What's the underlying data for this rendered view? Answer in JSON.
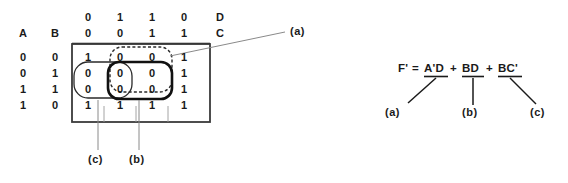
{
  "diagram": {
    "title_note": "Karnaugh map with three groupings and resulting simplified expression",
    "kmap": {
      "row_var_labels": [
        "A",
        "B"
      ],
      "col_var_labels": [
        "D",
        "C"
      ],
      "col_headers_d": [
        "0",
        "1",
        "1",
        "0"
      ],
      "col_headers_c": [
        "0",
        "0",
        "1",
        "1"
      ],
      "row_headers_a": [
        "0",
        "0",
        "1",
        "1"
      ],
      "row_headers_b": [
        "0",
        "1",
        "1",
        "0"
      ],
      "cells": [
        [
          "1",
          "0",
          "0",
          "1"
        ],
        [
          "0",
          "0",
          "0",
          "1"
        ],
        [
          "0",
          "0",
          "0",
          "1"
        ],
        [
          "1",
          "1",
          "1",
          "1"
        ]
      ]
    },
    "groups": [
      {
        "id": "a",
        "label": "(a)",
        "style": "dashed",
        "term": "A'D",
        "covers_rows": [
          0,
          1,
          2
        ],
        "covers_cols": [
          1,
          2
        ]
      },
      {
        "id": "b",
        "label": "(b)",
        "style": "bold",
        "term": "BD",
        "covers_rows": [
          1,
          2
        ],
        "covers_cols": [
          1,
          2
        ]
      },
      {
        "id": "c",
        "label": "(c)",
        "style": "thin",
        "term": "BC'",
        "covers_rows": [
          1,
          2
        ],
        "covers_cols": [
          0
        ]
      }
    ],
    "callouts": {
      "a": "(a)",
      "b": "(b)",
      "c": "(c)"
    },
    "equation": {
      "lhs": "F'",
      "equals": "=",
      "terms": [
        "A'D",
        "BD",
        "BC'"
      ],
      "plus": "+",
      "full_text": "F' = A'D + BD + BC'",
      "term_labels": [
        "(a)",
        "(b)",
        "(c)"
      ]
    },
    "colors": {
      "ink": "#1a1a1a",
      "background": "#ffffff",
      "leader_line": "#7a7a7a"
    }
  }
}
